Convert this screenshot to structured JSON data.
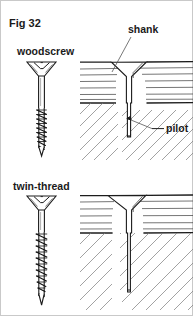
{
  "figure": {
    "number_label": "Fig 32",
    "caption_labels": {
      "woodscrew": "woodscrew",
      "twin_thread": "twin-thread",
      "shank": "shank",
      "pilot": "pilot"
    },
    "colors": {
      "ink": "#1c1c1c",
      "grain": "#3a3a3a",
      "hatch": "#7a7a7a",
      "leader": "#555555",
      "background": "#ffffff",
      "frame": "#c9c9c9"
    },
    "panels": [
      {
        "name": "woodscrew-panel",
        "screw_label": "woodscrew",
        "callouts": [
          "shank",
          "pilot"
        ],
        "head_type": "countersunk-slotted",
        "thread_style": "single-thread-lower-half"
      },
      {
        "name": "twin-thread-panel",
        "screw_label": "twin-thread",
        "callouts": [],
        "head_type": "countersunk-slotted",
        "thread_style": "twin-thread-full-length"
      }
    ]
  }
}
